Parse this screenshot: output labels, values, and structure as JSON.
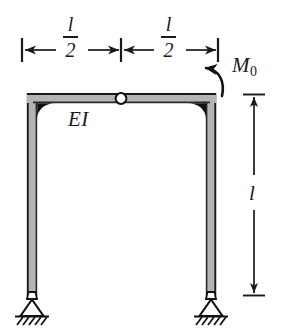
{
  "figure": {
    "background_color": "#ffffff",
    "ink_color": "#1a1a1a",
    "member_fill_color": "#b4b4b4",
    "gusset_color": "#111111",
    "hinge_fill_color": "#ffffff"
  },
  "labels": {
    "span_left": {
      "numerator": "l",
      "denominator": "2"
    },
    "span_right": {
      "numerator": "l",
      "denominator": "2"
    },
    "stiffness": "EI",
    "height": "l",
    "moment": "M",
    "moment_subscript": "0"
  },
  "icons": {
    "hinge": "hinge-circle-icon",
    "left_support": "pinned-support-icon",
    "right_support": "pinned-support-icon",
    "moment_arrow": "counterclockwise-moment-arrow-icon",
    "left_dimension_arrow": "dimension-arrow-icon",
    "right_dimension_arrow": "dimension-arrow-icon",
    "height_dimension_arrow": "vertical-dimension-arrow-icon"
  },
  "geometry": {
    "frame_left_x": 27,
    "frame_right_x": 216,
    "beam_top_y": 93,
    "column_bottom_y": 296,
    "hinge_x": 121,
    "hinge_y": 100,
    "member_thickness": 10,
    "dimension_top_y": 50,
    "dimension_right_x": 254
  }
}
